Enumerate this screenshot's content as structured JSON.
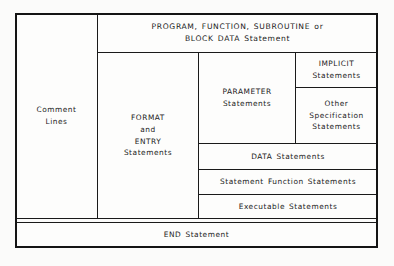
{
  "diagram": {
    "type": "nested-block-layout",
    "colors": {
      "line": "#141414",
      "text": "#1b1b1b",
      "background": "#fbfbfa",
      "cell_fill": "#fdfdfc"
    },
    "blocks": {
      "comment_lines": "Comment\nLines",
      "program_header": "PROGRAM, FUNCTION, SUBROUTINE or\nBLOCK DATA Statement",
      "format_entry": "FORMAT\nand\nENTRY\nStatements",
      "parameter": "PARAMETER\nStatements",
      "implicit": "IMPLICIT\nStatements",
      "other_specification": "Other\nSpecification\nStatements",
      "data_statements": "DATA Statements",
      "statement_function": "Statement Function Statements",
      "executable": "Executable Statements",
      "end_statement": "END Statement"
    }
  }
}
